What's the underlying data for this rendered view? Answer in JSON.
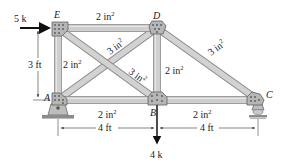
{
  "colors": {
    "member_fill": "#c9c9c9",
    "member_edge": "#8a8a8a",
    "gusset_fill": "#b8b8b8",
    "gusset_edge": "#6a6a6a",
    "load_arrow": "#111111",
    "dimension_line": "#333333",
    "ground": "#888888"
  },
  "joints": [
    {
      "id": "E",
      "label": "E"
    },
    {
      "id": "D",
      "label": "D"
    },
    {
      "id": "A",
      "label": "A"
    },
    {
      "id": "B",
      "label": "B"
    },
    {
      "id": "C",
      "label": "C"
    }
  ],
  "members": [
    {
      "from": "E",
      "to": "D",
      "area": "2 in",
      "exp": "2"
    },
    {
      "from": "E",
      "to": "A",
      "area": "2 in",
      "exp": "2"
    },
    {
      "from": "D",
      "to": "B",
      "area": "2 in",
      "exp": "2"
    },
    {
      "from": "A",
      "to": "B",
      "area": "2 in",
      "exp": "2"
    },
    {
      "from": "B",
      "to": "C",
      "area": "2 in",
      "exp": "2"
    },
    {
      "from": "A",
      "to": "D",
      "area": "3 in",
      "exp": "2"
    },
    {
      "from": "E",
      "to": "B",
      "area": "3 in",
      "exp": "2"
    },
    {
      "from": "D",
      "to": "C",
      "area": "3 in",
      "exp": "2"
    }
  ],
  "loads": [
    {
      "joint": "E",
      "label": "5 k",
      "direction": "right"
    },
    {
      "joint": "B",
      "label": "4 k",
      "direction": "down"
    }
  ],
  "dimensions": [
    {
      "label": "3 ft",
      "between": "A-E",
      "orientation": "vertical"
    },
    {
      "label": "4 ft",
      "between": "A-B",
      "orientation": "horizontal"
    },
    {
      "label": "4 ft",
      "between": "B-C",
      "orientation": "horizontal"
    }
  ],
  "supports": [
    {
      "joint": "A",
      "type": "pin"
    },
    {
      "joint": "C",
      "type": "roller"
    }
  ]
}
